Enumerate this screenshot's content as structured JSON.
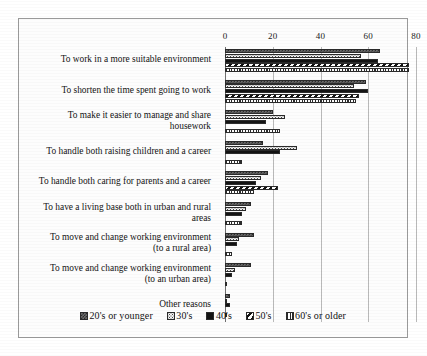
{
  "chart_data": {
    "type": "bar",
    "orientation": "horizontal",
    "title": "",
    "xlabel": "",
    "ylabel": "",
    "xlim": [
      0,
      80
    ],
    "xticks": [
      0,
      20,
      40,
      60,
      80
    ],
    "xtick_labels": [
      "0",
      "20",
      "40",
      "60",
      "80"
    ],
    "grid": true,
    "legend_position": "bottom",
    "categories": [
      "To work in a more suitable environment",
      "To shorten the time spent going to work",
      "To make it easier to manage and share\nhousework",
      "To handle both raising children and a career",
      "To handle both caring for parents and a career",
      "To have a living base both in urban and rural\nareas",
      "To move and change working environment\n(to a rural area)",
      "To move and change working environment\n(to an urban area)",
      "Other reasons"
    ],
    "series": [
      {
        "name": "20's or younger",
        "pattern": "dark-checker",
        "values": [
          65,
          59,
          20,
          16,
          18,
          11,
          12,
          11,
          2
        ]
      },
      {
        "name": "30's",
        "pattern": "light-dots",
        "values": [
          57,
          54,
          25,
          30,
          15,
          9,
          6,
          4,
          1
        ]
      },
      {
        "name": "40's",
        "pattern": "solid-black",
        "values": [
          64,
          60,
          17,
          23,
          13,
          7,
          5,
          3,
          2
        ]
      },
      {
        "name": "50's",
        "pattern": "diagonal-stripes",
        "values": [
          77,
          56,
          0,
          0,
          22,
          0,
          0,
          0,
          0
        ]
      },
      {
        "name": "60's or older",
        "pattern": "vertical-bars",
        "values": [
          77,
          55,
          23,
          7,
          12,
          7,
          3,
          1,
          1
        ]
      }
    ]
  },
  "legend": {
    "items": [
      {
        "label": "20's or younger"
      },
      {
        "label": "30's"
      },
      {
        "label": "40's"
      },
      {
        "label": "50's"
      },
      {
        "label": "60's or older"
      }
    ]
  }
}
